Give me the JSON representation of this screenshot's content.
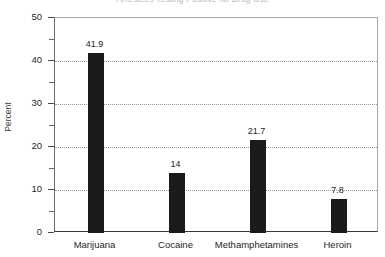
{
  "chart_data": {
    "type": "bar",
    "title": "Arrestees Testing Positive for Drug Use",
    "xlabel": "",
    "ylabel": "Percent",
    "categories": [
      "Marijuana",
      "Cocaine",
      "Methamphetamines",
      "Heroin"
    ],
    "values": [
      41.9,
      14,
      21.7,
      7.8
    ],
    "value_labels": [
      "41.9",
      "14",
      "21.7",
      "7.8"
    ],
    "ylim": [
      0,
      50
    ],
    "y_ticks": [
      0,
      10,
      20,
      30,
      40,
      50
    ],
    "y_tick_labels": [
      "0",
      "10",
      "20",
      "30",
      "40",
      "50"
    ],
    "y_minor_ticks": [
      5,
      15,
      25,
      35,
      45
    ],
    "gridlines_at": [
      10,
      20,
      30,
      40
    ],
    "grid": true,
    "legend": false,
    "bar_color": "#1b1b1b",
    "grid_color": "#9a9a9c",
    "title_color": "#b9b9bb",
    "axis_color": "#3a3a3c"
  }
}
